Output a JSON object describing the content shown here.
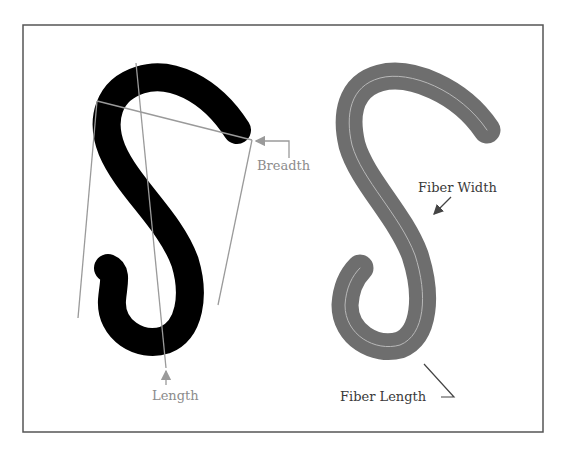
{
  "figure": {
    "frame": {
      "x": 23,
      "y": 25,
      "width": 520,
      "height": 407,
      "stroke": "#555555"
    },
    "left_panel": {
      "description": "Black S-shaped fiber with bounding guide lines",
      "fill": "#000000",
      "guide_color": "#9a9a9a",
      "labels": {
        "breadth": "Breadth",
        "length": "Length"
      }
    },
    "right_panel": {
      "description": "Grey S-shaped fiber with centerline skeleton",
      "fill": "#6e6e6e",
      "centerline_color": "#b8b8b8",
      "labels": {
        "fiber_width": "Fiber Width",
        "fiber_length": "Fiber Length"
      }
    }
  }
}
